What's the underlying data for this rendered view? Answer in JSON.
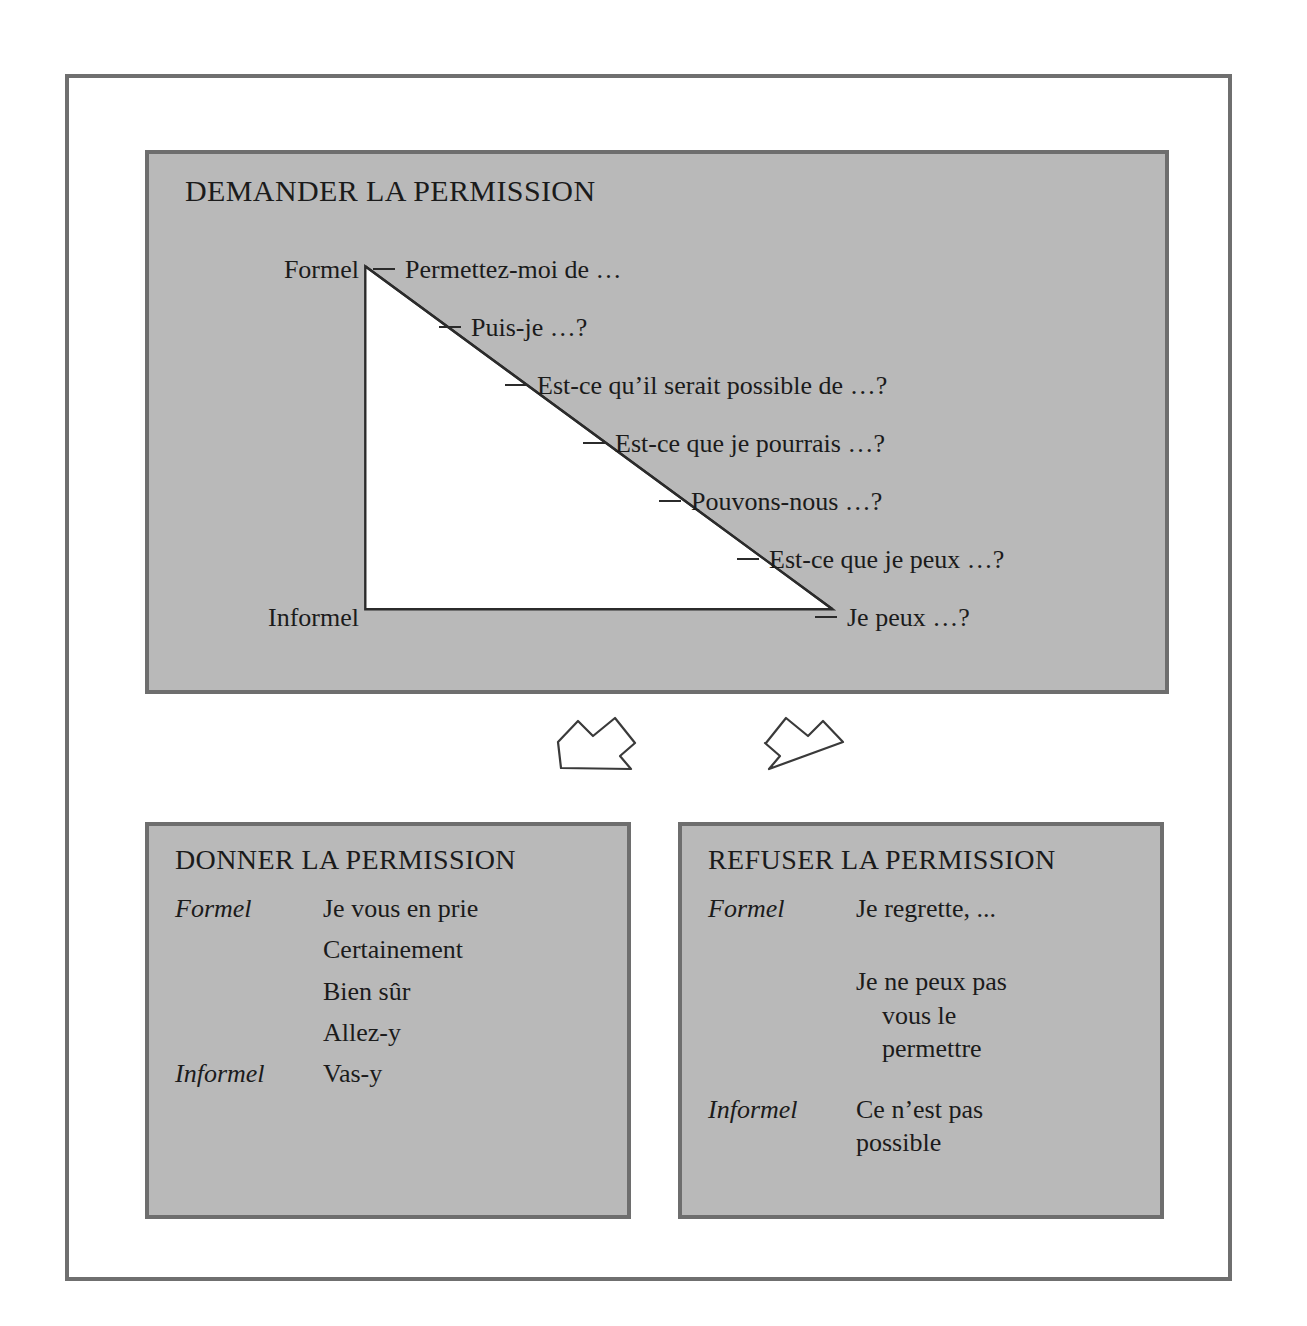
{
  "diagram": {
    "ask_panel": {
      "title": "DEMANDER LA PERMISSION",
      "axis_top_label": "Formel",
      "axis_bottom_label": "Informel",
      "rows": [
        "Permettez-moi de …",
        "Puis-je …?",
        "Est-ce qu’il serait possible de …?",
        "Est-ce que je pourrais …?",
        "Pouvons-nous …?",
        "Est-ce que je peux …?",
        "Je peux …?"
      ]
    },
    "give_panel": {
      "title": "DONNER LA PERMISSION",
      "rows": [
        {
          "level": "Formel",
          "phrases": [
            "Je vous en prie"
          ]
        },
        {
          "level": "",
          "phrases": [
            "Certainement"
          ]
        },
        {
          "level": "",
          "phrases": [
            "Bien sûr"
          ]
        },
        {
          "level": "",
          "phrases": [
            "Allez-y"
          ]
        },
        {
          "level": "Informel",
          "phrases": [
            "Vas-y"
          ]
        }
      ]
    },
    "refuse_panel": {
      "title": "REFUSER LA PERMISSION",
      "rows": [
        {
          "level": "Formel",
          "phrases": [
            "Je regrette, ..."
          ]
        },
        {
          "level": "",
          "phrases": [
            "Je ne peux pas",
            "vous le",
            "permettre"
          ]
        },
        {
          "level": "Informel",
          "phrases": [
            "Ce n’est pas",
            "possible"
          ]
        }
      ]
    },
    "arrows": [
      {
        "name": "arrow-to-give-permission",
        "direction": "down-left"
      },
      {
        "name": "arrow-to-refuse-permission",
        "direction": "down-right"
      }
    ],
    "colors": {
      "panel_fill": "#b9b9b9",
      "panel_border": "#6e6e6e",
      "frame_border": "#6f6f6f",
      "triangle_fill": "#ffffff",
      "ink": "#1b1b1b"
    }
  }
}
